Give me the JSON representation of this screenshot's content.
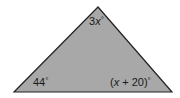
{
  "diagram": {
    "type": "triangle",
    "fill_color": "#a8a8a8",
    "stroke_color": "#222222",
    "vertices": {
      "top": [
        98,
        7
      ],
      "bottom_left": [
        14,
        92
      ],
      "bottom_right": [
        172,
        92
      ]
    },
    "angles": {
      "top": {
        "coefficient": "3",
        "variable": "x",
        "unit": "°"
      },
      "bottom_left": {
        "value": "44",
        "unit": "°"
      },
      "bottom_right": {
        "open": "(",
        "variable": "x",
        "rest": " + 20)",
        "unit": "°"
      }
    }
  }
}
